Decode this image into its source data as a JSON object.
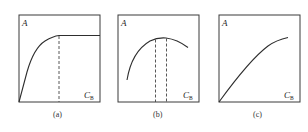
{
  "figure": {
    "panels": [
      {
        "id": "a",
        "caption": "(a)",
        "y_label": "A",
        "x_label_main": "C",
        "x_label_sub": "B",
        "description": "A rises steeply from origin then levels off to a plateau; dashed line marks onset of plateau"
      },
      {
        "id": "b",
        "caption": "(b)",
        "y_label": "A",
        "x_label_main": "C",
        "x_label_sub": "B",
        "description": "A rises to a maximum then decreases; two dashed lines bracket the maximum region"
      },
      {
        "id": "c",
        "caption": "(c)",
        "y_label": "A",
        "x_label_main": "C",
        "x_label_sub": "B",
        "description": "A increases monotonically from origin with slight downward curvature"
      }
    ]
  }
}
